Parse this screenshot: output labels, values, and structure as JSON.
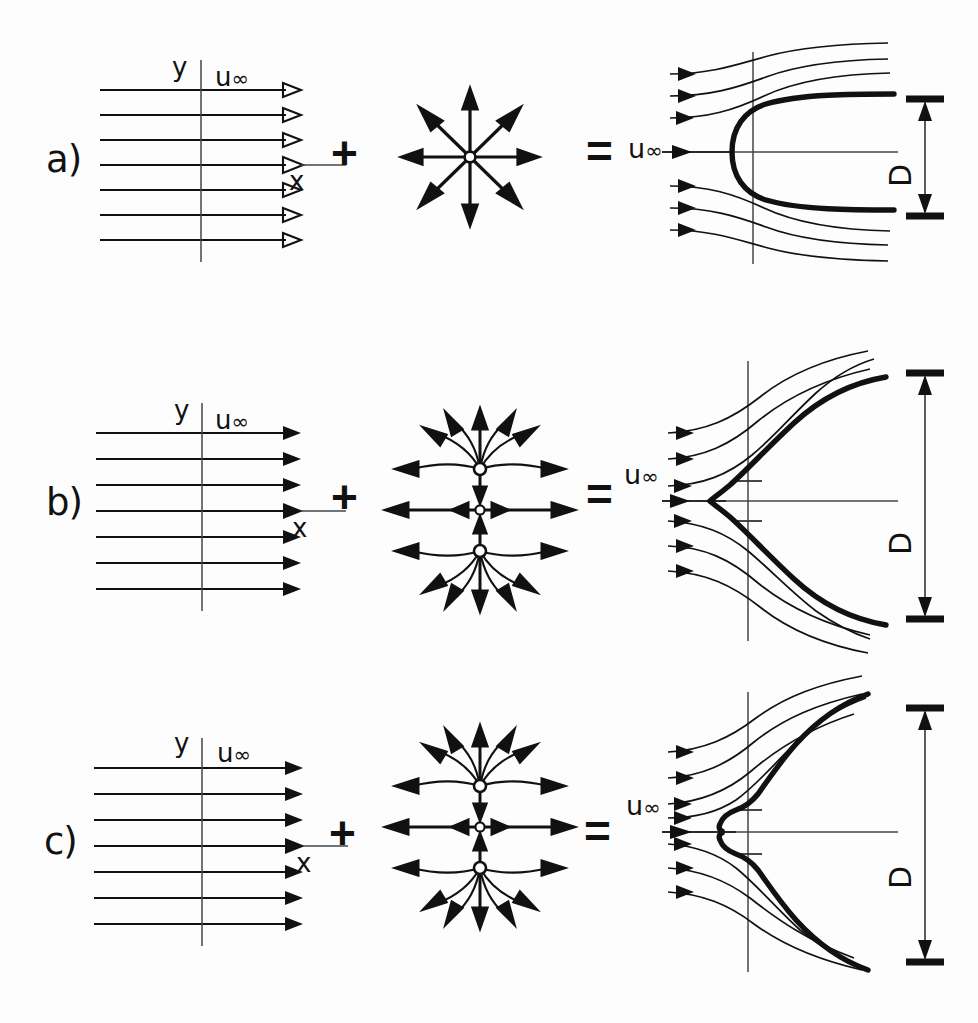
{
  "figure": {
    "background_color": "#fdfdfd",
    "ink_color": "#111111",
    "rows": [
      {
        "label": "a)",
        "uniform_flow": {
          "streamline_count": 7,
          "y_axis_label": "y",
          "x_axis_label": "x",
          "velocity_label": "u",
          "velocity_subscript": "∞"
        },
        "operator_plus": "+",
        "source_panel": {
          "kind": "single-source",
          "source_count": 1,
          "ray_count": 8,
          "rays_curved": false
        },
        "operator_equals": "=",
        "result": {
          "kind": "rankine-half-body",
          "velocity_label": "u",
          "velocity_subscript": "∞",
          "inflow_streamline_count": 6,
          "dimension_label": "D",
          "axis_tick_count": 0,
          "nose_shape": "rounded"
        }
      },
      {
        "label": "b)",
        "uniform_flow": {
          "streamline_count": 7,
          "y_axis_label": "y",
          "x_axis_label": "x",
          "velocity_label": "u",
          "velocity_subscript": "∞"
        },
        "operator_plus": "+",
        "source_panel": {
          "kind": "two-sources-plus-center",
          "source_count": 2,
          "center_point": true,
          "ray_count": 14,
          "rays_curved": true
        },
        "operator_equals": "=",
        "result": {
          "kind": "wide-half-body",
          "velocity_label": "u",
          "velocity_subscript": "∞",
          "inflow_streamline_count": 6,
          "dimension_label": "D",
          "axis_tick_count": 2,
          "nose_shape": "blunt-rounded"
        }
      },
      {
        "label": "c)",
        "uniform_flow": {
          "streamline_count": 7,
          "y_axis_label": "y",
          "x_axis_label": "x",
          "velocity_label": "u",
          "velocity_subscript": "∞"
        },
        "operator_plus": "+",
        "source_panel": {
          "kind": "two-sources-plus-center",
          "source_count": 2,
          "center_point": true,
          "ray_count": 14,
          "rays_curved": true
        },
        "operator_equals": "=",
        "result": {
          "kind": "notched-half-body",
          "velocity_label": "u",
          "velocity_subscript": "∞",
          "inflow_streamline_count": 7,
          "dimension_label": "D",
          "axis_tick_count": 2,
          "nose_shape": "waisted-notched"
        }
      }
    ]
  }
}
